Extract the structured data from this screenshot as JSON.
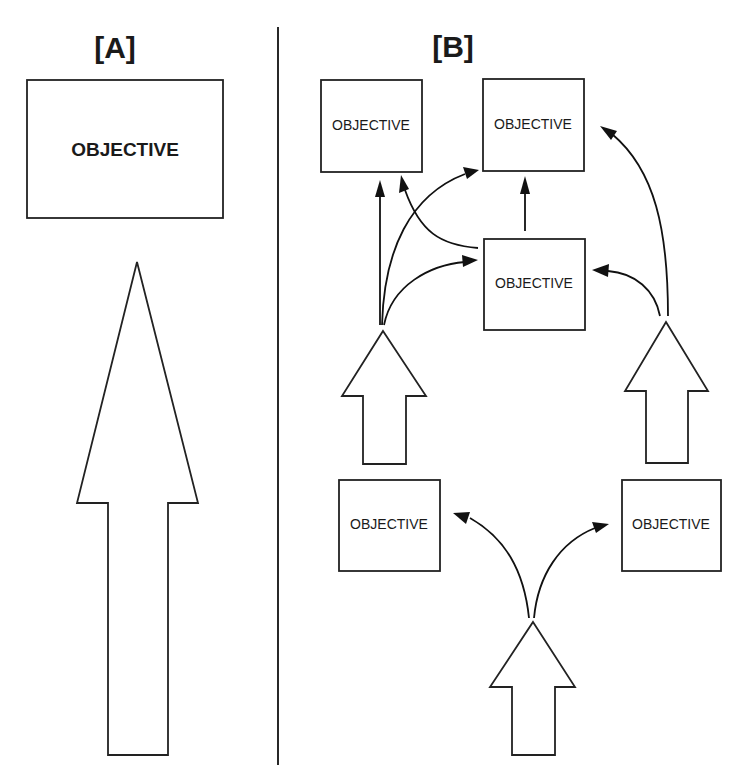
{
  "panels": {
    "a": {
      "label": "[A]",
      "objective": "OBJECTIVE"
    },
    "b": {
      "label": "[B]",
      "objectives": [
        "OBJECTIVE",
        "OBJECTIVE",
        "OBJECTIVE",
        "OBJECTIVE",
        "OBJECTIVE"
      ]
    }
  },
  "colors": {
    "stroke": "#222222",
    "background": "#ffffff"
  }
}
